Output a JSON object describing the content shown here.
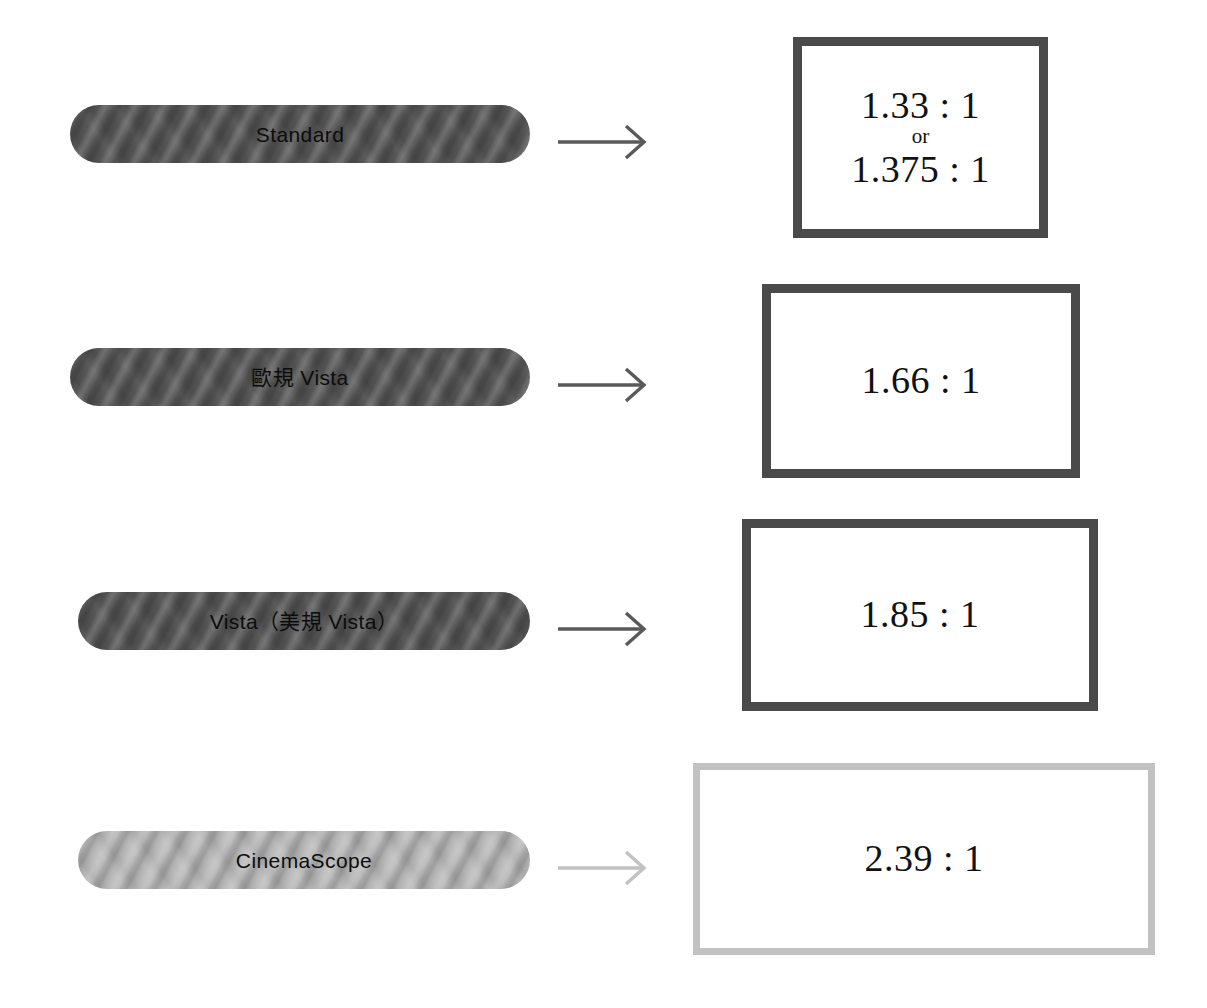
{
  "diagram": {
    "rows": [
      {
        "id": "standard",
        "label": "Standard",
        "arrow": "right-arrow",
        "ratio_primary": "1.33 : 1",
        "ratio_connector": "or",
        "ratio_secondary": "1.375 : 1",
        "frame_color": "#4a4a4a",
        "pill_color": "#545454"
      },
      {
        "id": "euro-vista",
        "label": "歐規 Vista",
        "arrow": "right-arrow",
        "ratio_primary": "1.66 : 1",
        "ratio_connector": "",
        "ratio_secondary": "",
        "frame_color": "#4a4a4a",
        "pill_color": "#545454"
      },
      {
        "id": "vista",
        "label": "Vista（美規 Vista）",
        "arrow": "right-arrow",
        "ratio_primary": "1.85 : 1",
        "ratio_connector": "",
        "ratio_secondary": "",
        "frame_color": "#4a4a4a",
        "pill_color": "#545454"
      },
      {
        "id": "cinemascope",
        "label": "CinemaScope",
        "arrow": "right-arrow",
        "ratio_primary": "2.39 : 1",
        "ratio_connector": "",
        "ratio_secondary": "",
        "frame_color": "#c2c2c2",
        "pill_color": "#b9b9b9"
      }
    ]
  }
}
